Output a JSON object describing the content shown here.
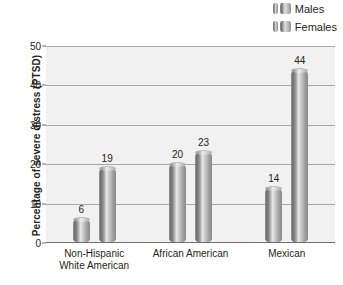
{
  "chart_data": {
    "type": "bar",
    "title": "",
    "subtitle": "",
    "xlabel": "",
    "ylabel": "Percentage of severe distress (PTSD)",
    "categories": [
      "Non-Hispanic White American",
      "African American",
      "Mexican"
    ],
    "category_lines": [
      [
        "Non-Hispanic",
        "White American"
      ],
      [
        "African American",
        ""
      ],
      [
        "Mexican",
        ""
      ]
    ],
    "series": [
      {
        "name": "Males",
        "values": [
          6,
          20,
          14
        ]
      },
      {
        "name": "Females",
        "values": [
          19,
          23,
          44
        ]
      }
    ],
    "ylim": [
      0,
      50
    ],
    "yticks": [
      0,
      10,
      20,
      30,
      40,
      50
    ],
    "ytick_labels": [
      "0",
      "10",
      "20",
      "30",
      "40",
      "50"
    ],
    "grid": true,
    "grid_axis": "y",
    "legend_position": "top-right",
    "data_labels": true,
    "bar_style": "3d-cylinder",
    "colors": {
      "plot_background": "#f1f1f1",
      "gridline": "#a8a8a8",
      "axis": "#6d6d6d",
      "text": "#231f20",
      "bar_light": "#e6e6e6",
      "bar_mid": "#9f9f9f",
      "bar_dark": "#6e6e6e"
    }
  },
  "legend": {
    "items": [
      {
        "label": "Males"
      },
      {
        "label": "Females"
      }
    ]
  }
}
